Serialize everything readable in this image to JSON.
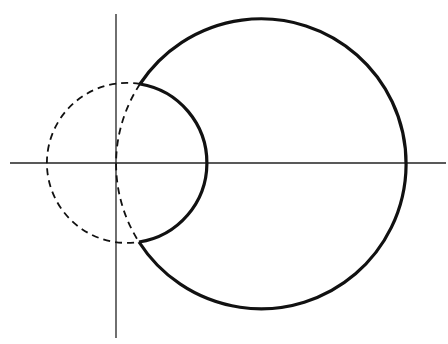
{
  "diagram": {
    "width": 448,
    "height": 344,
    "background": "#ffffff",
    "stroke_color": "#111111",
    "axes": {
      "x_axis": {
        "x1": 10,
        "y1": 163,
        "x2": 446,
        "y2": 163,
        "stroke_width": 1.3
      },
      "y_axis": {
        "x1": 116,
        "y1": 14,
        "x2": 116,
        "y2": 338,
        "stroke_width": 1.3
      }
    },
    "large_circle": {
      "cx": 260,
      "cy": 163,
      "r": 145,
      "style": "solid"
    },
    "small_circle": {
      "cx": 117,
      "cy": 163,
      "r": 80,
      "style": "dashed"
    },
    "cusps": [
      {
        "x": 140,
        "y": 84
      },
      {
        "x": 139,
        "y": 242
      }
    ],
    "boundary_description": "Solid region boundary: large circle minus the portion inside small dashed circle; inner solid arc is the right arc of the small circle between cusps."
  }
}
